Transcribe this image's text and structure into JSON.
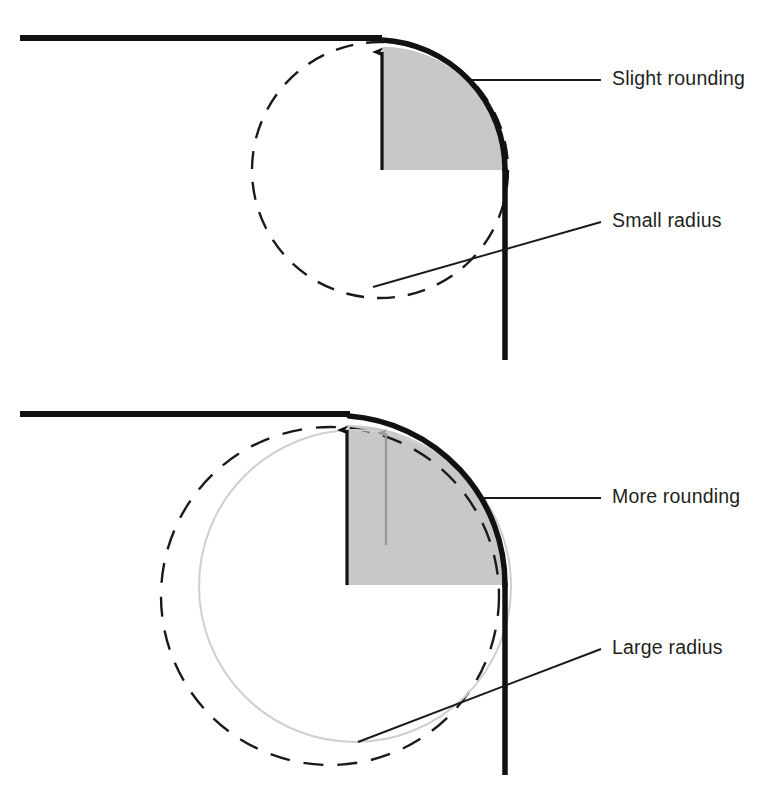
{
  "figure": {
    "background_color": "#ffffff"
  },
  "colors": {
    "edge_stroke": "#111111",
    "shaded_fill": "#c8c8c8",
    "dashed_circle": "#1a1a1a",
    "light_circle": "#cfcfcf",
    "gray_arrow": "#9a9a9a",
    "leader_line": "#1a1a1a",
    "label_text": "#231f20"
  },
  "panels": [
    {
      "id": "top-panel",
      "name": "slight-rounding-panel",
      "corner": {
        "horizontal_edge": {
          "x1": 20,
          "y1": 38,
          "x2": 367,
          "y2": 38
        },
        "vertical_edge": {
          "x1": 505,
          "y1": 170,
          "x2": 505,
          "y2": 360
        },
        "arc": {
          "cx": 382,
          "cy": 170,
          "r": 123,
          "start": "top",
          "end": "right"
        },
        "stroke_width": 5
      },
      "radius_arrow": {
        "name": "small-radius-arrow",
        "from": {
          "x": 382,
          "y": 170
        },
        "to": {
          "x": 382,
          "y": 40
        },
        "color": "#111111"
      },
      "shaded_region": {
        "name": "small-rounding-shaded-quadrant",
        "cx": 382,
        "cy": 170,
        "r": 123,
        "fill": "#c8c8c8"
      },
      "dashed_circle": {
        "name": "small-radius-construction-circle",
        "cx": 380,
        "cy": 170,
        "r": 128,
        "dash": "18 13"
      },
      "labels": [
        {
          "id": "slight-rounding",
          "name": "label-slight-rounding",
          "text": "Slight rounding",
          "text_x": 612,
          "text_y": 80,
          "leader": {
            "x1": 472,
            "y1": 80,
            "x2": 601,
            "y2": 80
          }
        },
        {
          "id": "small-radius",
          "name": "label-small-radius",
          "text": "Small radius",
          "text_x": 612,
          "text_y": 222,
          "leader": {
            "x1": 373,
            "y1": 287,
            "x2": 601,
            "y2": 222
          }
        }
      ]
    },
    {
      "id": "bottom-panel",
      "name": "more-rounding-panel",
      "corner": {
        "horizontal_edge": {
          "x1": 20,
          "y1": 414,
          "x2": 350,
          "y2": 414
        },
        "vertical_edge": {
          "x1": 505,
          "y1": 585,
          "x2": 505,
          "y2": 775
        },
        "arc": {
          "cx": 347,
          "cy": 585,
          "r": 160,
          "start": "top",
          "end": "right"
        },
        "stroke_width": 5
      },
      "radius_arrow": {
        "name": "large-radius-arrow",
        "from": {
          "x": 347,
          "y": 585
        },
        "to": {
          "x": 347,
          "y": 420
        },
        "color": "#111111"
      },
      "small_radius_arrow": {
        "name": "reference-small-radius-arrow",
        "from": {
          "x": 385,
          "y": 545
        },
        "to": {
          "x": 385,
          "y": 424
        },
        "color": "#9a9a9a"
      },
      "shaded_region": {
        "name": "large-rounding-shaded-quadrant",
        "cx": 347,
        "cy": 585,
        "r": 160,
        "fill": "#c8c8c8"
      },
      "dashed_circle": {
        "name": "large-radius-construction-circle",
        "cx": 330,
        "cy": 595,
        "r": 168,
        "dash": "20 14"
      },
      "light_circle": {
        "name": "inner-reference-circle",
        "cx": 355,
        "cy": 585,
        "r": 155,
        "stroke": "#cfcfcf"
      },
      "labels": [
        {
          "id": "more-rounding",
          "name": "label-more-rounding",
          "text": "More rounding",
          "text_x": 612,
          "text_y": 498,
          "leader": {
            "x1": 478,
            "y1": 498,
            "x2": 601,
            "y2": 498
          }
        },
        {
          "id": "large-radius",
          "name": "label-large-radius",
          "text": "Large radius",
          "text_x": 612,
          "text_y": 649,
          "leader": {
            "x1": 358,
            "y1": 742,
            "x2": 601,
            "y2": 649
          }
        }
      ]
    }
  ]
}
